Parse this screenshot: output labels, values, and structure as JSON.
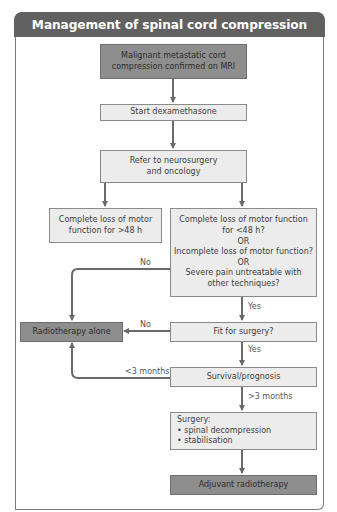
{
  "title": "Management of spinal cord compression",
  "colors": {
    "header_bg": "#616161",
    "dark_box": "#8e8e8e",
    "light_box": "#ececec",
    "arrow": "#6a6a6a"
  },
  "nodes": {
    "mri": {
      "lines": [
        "Malignant metastatic cord",
        "compression confirmed on MRI"
      ],
      "style": "dark"
    },
    "dexa": {
      "lines": [
        "Start dexamethasone"
      ],
      "style": "light"
    },
    "refer": {
      "lines": [
        "Refer to neurosurgery",
        "and oncology"
      ],
      "style": "light"
    },
    "complete_loss": {
      "lines": [
        "Complete loss of motor",
        "function for >48 h"
      ],
      "style": "light"
    },
    "criteria": {
      "lines": [
        "Complete loss of motor function",
        "for <48 h?",
        "OR",
        "Incomplete loss of motor function?",
        "OR",
        "Severe pain untreatable with",
        "other techniques?"
      ],
      "style": "light"
    },
    "radio_alone": {
      "lines": [
        "Radiotherapy alone"
      ],
      "style": "dark"
    },
    "fit": {
      "lines": [
        "Fit for surgery?"
      ],
      "style": "light"
    },
    "survival": {
      "lines": [
        "Survival/prognosis"
      ],
      "style": "light"
    },
    "surgery": {
      "lines": [
        "Surgery:",
        "• spinal decompression",
        "• stabilisation"
      ],
      "style": "light"
    },
    "adjuvant": {
      "lines": [
        "Adjuvant radiotherapy"
      ],
      "style": "dark"
    }
  },
  "edge_labels": {
    "criteria_no": "No",
    "criteria_yes": "Yes",
    "fit_no": "No",
    "fit_yes": "Yes",
    "survival_short": "<3 months",
    "survival_long": ">3 months"
  },
  "edges": [
    {
      "from": "mri",
      "to": "dexa"
    },
    {
      "from": "dexa",
      "to": "refer"
    },
    {
      "from": "refer",
      "to": "complete_loss"
    },
    {
      "from": "refer",
      "to": "criteria"
    },
    {
      "from": "criteria",
      "to": "radio_alone",
      "label": "No"
    },
    {
      "from": "criteria",
      "to": "fit",
      "label": "Yes"
    },
    {
      "from": "fit",
      "to": "radio_alone",
      "label": "No"
    },
    {
      "from": "fit",
      "to": "survival",
      "label": "Yes"
    },
    {
      "from": "survival",
      "to": "radio_alone",
      "label": "<3 months"
    },
    {
      "from": "survival",
      "to": "surgery",
      "label": ">3 months"
    },
    {
      "from": "surgery",
      "to": "adjuvant"
    }
  ]
}
